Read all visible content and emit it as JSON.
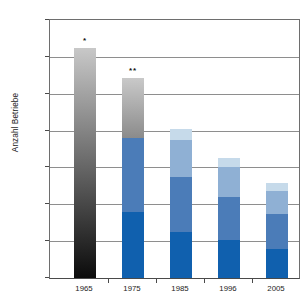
{
  "chart_data": {
    "type": "bar",
    "title": "",
    "xlabel": "",
    "ylabel": "Anzahl Betriebe",
    "ylim": [
      0,
      70000
    ],
    "ytick_labels": [
      "0",
      "10'000",
      "20'000",
      "30'000",
      "40'000",
      "50'000",
      "60'000",
      "70'000"
    ],
    "ytick_values": [
      0,
      10000,
      20000,
      30000,
      40000,
      50000,
      60000,
      70000
    ],
    "grid": true,
    "legend": "none",
    "stacked": true,
    "categories": [
      "1965",
      "1975",
      "1985",
      "1996",
      "2005"
    ],
    "totals": [
      62300,
      54200,
      40500,
      32500,
      25700
    ],
    "annotations": [
      {
        "category": "1965",
        "text": "*"
      },
      {
        "category": "1975",
        "text": "**"
      }
    ],
    "series": [
      {
        "name": "segment-1",
        "values": [
          null,
          18000,
          12500,
          10200,
          8000
        ]
      },
      {
        "name": "segment-2",
        "values": [
          null,
          20000,
          15000,
          11800,
          9500
        ]
      },
      {
        "name": "segment-3",
        "values": [
          null,
          16200,
          10000,
          8000,
          6000
        ]
      },
      {
        "name": "segment-4",
        "values": [
          null,
          null,
          3000,
          2500,
          2200
        ]
      }
    ],
    "bars": [
      {
        "category": "1965",
        "total": 62300,
        "marker": "*",
        "segments": [
          {
            "name": "gradient-black-gray",
            "from": 0,
            "to": 62300,
            "color": "#0b0b0b",
            "color_top": "#c8c8c8",
            "gradient": true
          }
        ]
      },
      {
        "category": "1975",
        "total": 54200,
        "marker": "**",
        "segments": [
          {
            "name": "dark-blue",
            "from": 0,
            "to": 18000,
            "color": "#1060ae"
          },
          {
            "name": "medium-blue",
            "from": 18000,
            "to": 38000,
            "color": "#4b7cb8"
          },
          {
            "name": "gradient-gray",
            "from": 38000,
            "to": 54200,
            "color": "#8b8b8b",
            "color_top": "#c9c9c9",
            "gradient": true
          }
        ]
      },
      {
        "category": "1985",
        "total": 40500,
        "marker": "",
        "segments": [
          {
            "name": "dark-blue",
            "from": 0,
            "to": 12500,
            "color": "#1060ae"
          },
          {
            "name": "medium-blue",
            "from": 12500,
            "to": 27500,
            "color": "#4b7cb8"
          },
          {
            "name": "light-blue",
            "from": 27500,
            "to": 37500,
            "color": "#8fb0d4"
          },
          {
            "name": "pale-blue",
            "from": 37500,
            "to": 40500,
            "color": "#c6daea"
          }
        ]
      },
      {
        "category": "1996",
        "total": 32500,
        "marker": "",
        "segments": [
          {
            "name": "dark-blue",
            "from": 0,
            "to": 10200,
            "color": "#1060ae"
          },
          {
            "name": "medium-blue",
            "from": 10200,
            "to": 22000,
            "color": "#4b7cb8"
          },
          {
            "name": "light-blue",
            "from": 22000,
            "to": 30000,
            "color": "#8fb0d4"
          },
          {
            "name": "pale-blue",
            "from": 30000,
            "to": 32500,
            "color": "#c6daea"
          }
        ]
      },
      {
        "category": "2005",
        "total": 25700,
        "marker": "",
        "segments": [
          {
            "name": "dark-blue",
            "from": 0,
            "to": 8000,
            "color": "#1060ae"
          },
          {
            "name": "medium-blue",
            "from": 8000,
            "to": 17500,
            "color": "#4b7cb8"
          },
          {
            "name": "light-blue",
            "from": 17500,
            "to": 23500,
            "color": "#8fb0d4"
          },
          {
            "name": "pale-blue",
            "from": 23500,
            "to": 25700,
            "color": "#c6daea"
          }
        ]
      }
    ]
  },
  "colors": {
    "axis": "#4a4a4a",
    "grid": "#8e8e8e",
    "text": "#1c1c1c",
    "background": "#ffffff"
  }
}
